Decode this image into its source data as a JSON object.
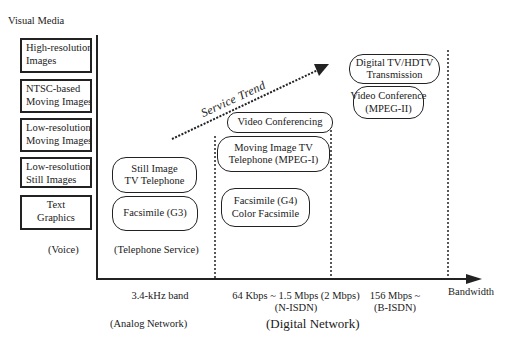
{
  "diagram": {
    "y_axis_title": "Visual Media",
    "x_axis_title": "Bandwidth",
    "media_categories": [
      {
        "line1": "High-resolution",
        "line2": "Images"
      },
      {
        "line1": "NTSC-based",
        "line2": "Moving Images"
      },
      {
        "line1": "Low-resolution",
        "line2": "Moving Images"
      },
      {
        "line1": "Low-resolution",
        "line2": "Still Images"
      },
      {
        "line1": "Text",
        "line2": "Graphics"
      }
    ],
    "voice_label": "(Voice)",
    "telephone_service_label": "(Telephone Service)",
    "services": {
      "still_image_tv": {
        "line1": "Still Image",
        "line2": "TV Telephone"
      },
      "facsimile_g3": {
        "line1": "Facsimile (G3)"
      },
      "video_conferencing": {
        "line1": "Video Conferencing"
      },
      "moving_image_tv": {
        "line1": "Moving Image TV",
        "line2": "Telephone (MPEG-I)"
      },
      "facsimile_g4": {
        "line1": "Facsimile (G4)",
        "line2": "Color Facsimile"
      },
      "video_conference_mpeg2": {
        "line1": "Video Conference",
        "line2": "(MPEG-II)"
      },
      "digital_tv_hdtv": {
        "line1": "Digital TV/HDTV",
        "line2": "Transmission"
      }
    },
    "trend_label": "Service Trend",
    "bandwidth_bands": [
      {
        "line1": "3.4-kHz band",
        "line2": ""
      },
      {
        "line1": "64 Kbps ~ 1.5 Mbps (2 Mbps)",
        "line2": "(N-ISDN)"
      },
      {
        "line1": "156 Mbps ~",
        "line2": "(B-ISDN)"
      }
    ],
    "network_labels": {
      "analog": "(Analog Network)",
      "digital": "(Digital Network)"
    }
  }
}
